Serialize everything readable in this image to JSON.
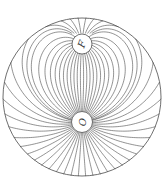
{
  "diagram": {
    "type": "field-lines",
    "stroke_color": "#4a4a4a",
    "background": "#ffffff",
    "boundary": {
      "cx": 82,
      "cy": 97,
      "r": 79
    },
    "source": {
      "label": "O",
      "cx": 82,
      "cy": 122,
      "r": 10.5,
      "label_rotation": 90
    },
    "obstacle": {
      "label": "F",
      "cx": 82,
      "cy": 44,
      "r": 10,
      "label_rotation": -70
    },
    "line_count": 56
  }
}
